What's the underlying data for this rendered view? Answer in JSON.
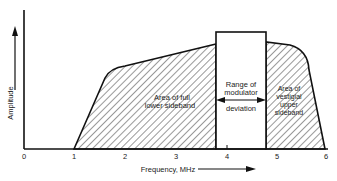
{
  "diagram": {
    "y_axis_label": "Amplitude",
    "x_axis_label": "Frequency, MHz",
    "x_ticks": [
      "0",
      "1",
      "2",
      "3",
      "4",
      "5",
      "6"
    ],
    "regions": {
      "lower": {
        "line1": "Area of full",
        "line2": "lower sideband"
      },
      "center": {
        "line1": "Range of",
        "line2": "modulator",
        "line3": "deviation"
      },
      "upper": {
        "line1": "Area of",
        "line2": "vestigial",
        "line3": "upper",
        "line4": "sideband"
      }
    }
  }
}
